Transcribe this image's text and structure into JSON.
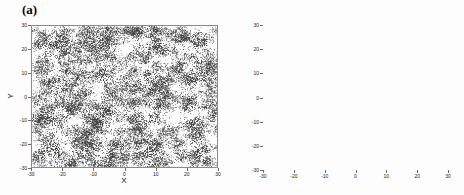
{
  "figure": {
    "background": "#fdfdfd",
    "width": 464,
    "height": 195
  },
  "panels": [
    {
      "id": "a",
      "label": "(a)",
      "xlabel": "X",
      "ylabel": "Y"
    },
    {
      "id": "b",
      "label": "(b)",
      "xlabel": "",
      "ylabel": ""
    }
  ],
  "chart_data": [
    {
      "type": "scatter",
      "title": "(a)",
      "xlabel": "X",
      "ylabel": "Y",
      "xlim": [
        -30,
        30
      ],
      "ylim": [
        -30,
        30
      ],
      "xticks": [
        -30,
        -20,
        -10,
        0,
        10,
        20,
        30
      ],
      "yticks": [
        -30,
        -20,
        -10,
        0,
        10,
        20,
        30
      ],
      "xticklabels": [
        "-30",
        "-20",
        "-10",
        "0",
        "10",
        "20",
        "30"
      ],
      "yticklabels": [
        "-30",
        "-20",
        "-10",
        "0",
        "10",
        "20",
        "30"
      ],
      "grid": false,
      "legend": null,
      "marker_color": "#3a3a3a",
      "marker_size": 0.7,
      "description": "Dense percolating network of overlapping point clusters filling the whole domain; clusters merge into connected dark filaments separated by white voids.",
      "n_points": 26000,
      "n_seeds": 560,
      "cluster_sigma": 1.15,
      "seed": 20240117
    },
    {
      "type": "scatter",
      "title": "(b)",
      "xlabel": "",
      "ylabel": "",
      "xlim": [
        -30,
        30
      ],
      "ylim": [
        -30,
        30
      ],
      "xticks": [
        -30,
        -20,
        -10,
        0,
        10,
        20,
        30
      ],
      "yticks": [
        -30,
        -20,
        -10,
        0,
        10,
        20,
        30
      ],
      "xticklabels": [
        "-30",
        "-20",
        "-10",
        "0",
        "10",
        "20",
        "30"
      ],
      "yticklabels": [
        "-30",
        "-20",
        "-10",
        "0",
        "10",
        "20",
        "30"
      ],
      "grid": true,
      "grid_style": "dotted",
      "grid_color": "#b8b8b8",
      "legend": null,
      "marker_color": "#2f2f2f",
      "marker_size": 0.6,
      "description": "Regular staggered (triangular) lattice of small isolated compact clusters; alternating rows offset by half a lattice spacing.",
      "lattice": {
        "row_spacing": 4.5,
        "col_spacing": 6.4,
        "row_offset": 3.2,
        "cluster_sigma": 0.34,
        "points_per_cluster": 26
      },
      "seed": 771
    }
  ]
}
